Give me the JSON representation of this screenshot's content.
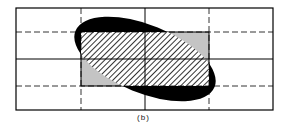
{
  "figure": {
    "caption": "(b)",
    "grid": {
      "columns": 4,
      "rows": 4,
      "solid_lines": [
        "outer-box",
        "center-vertical",
        "center-horizontal"
      ],
      "dashed_lines": [
        "x-quarter-left",
        "x-quarter-right",
        "y-quarter-top",
        "y-quarter-bottom"
      ]
    },
    "shapes": {
      "ellipse": {
        "fill": "#000000",
        "description": "rotated black ellipse"
      },
      "rectangle": {
        "fill": "#bdbdbd",
        "description": "gray rectangle covering middle two columns and rows"
      },
      "hatched_overlap": {
        "pattern": "diagonal hatch",
        "description": "intersection of ellipse and rectangle"
      }
    }
  }
}
